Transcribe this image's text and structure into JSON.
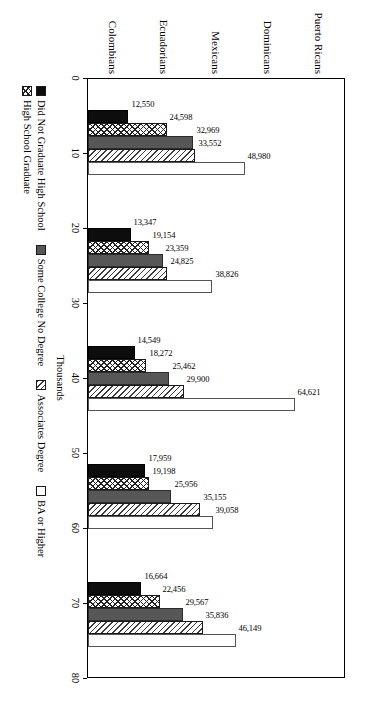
{
  "chart_data": {
    "type": "bar",
    "title": "",
    "subtitle": "",
    "orientation": "vertical",
    "grid": false,
    "legend_position": "bottom",
    "xlabel": "",
    "ylabel": "Thousands",
    "axis_title": "Thousands",
    "ylim": [
      0,
      80
    ],
    "ytick_labels": [
      "0",
      "10",
      "20",
      "30",
      "40",
      "50",
      "60",
      "70",
      "80"
    ],
    "ytick_values": [
      0,
      10,
      20,
      30,
      40,
      50,
      60,
      70,
      80
    ],
    "units_note": "Thousands",
    "categories": [
      "Puerto Ricans",
      "Dominicans",
      "Mexicans",
      "Ecuadorians",
      "Colombians"
    ],
    "series": [
      {
        "name": "Did Not Graduate High School",
        "fill": "solid-black",
        "color": "#0d0d0d",
        "values": [
          12550,
          13347,
          14549,
          17959,
          16664
        ],
        "labels": [
          "12,550",
          "13,347",
          "14,549",
          "17,959",
          "16,664"
        ]
      },
      {
        "name": "High School Graduate",
        "fill": "crosshatch",
        "color": "#ffffff",
        "values": [
          24598,
          19154,
          18272,
          19198,
          22456
        ],
        "labels": [
          "24,598",
          "19,154",
          "18,272",
          "19,198",
          "22,456"
        ]
      },
      {
        "name": "Some College No Degree",
        "fill": "solid-grey",
        "color": "#575757",
        "values": [
          32969,
          23359,
          25462,
          25956,
          29567
        ],
        "labels": [
          "32,969",
          "23,359",
          "25,462",
          "25,956",
          "29,567"
        ]
      },
      {
        "name": "Associates Degree",
        "fill": "diagonal-hatch",
        "color": "#ffffff",
        "values": [
          33552,
          24825,
          29900,
          35155,
          35836
        ],
        "labels": [
          "33,552",
          "24,825",
          "29,900",
          "35,155",
          "35,836"
        ]
      },
      {
        "name": "BA or Higher",
        "fill": "open-white",
        "color": "#ffffff",
        "values": [
          48980,
          38826,
          64621,
          39058,
          46149
        ],
        "labels": [
          "48,980",
          "38,826",
          "64,621",
          "39,058",
          "46,149"
        ]
      }
    ]
  }
}
